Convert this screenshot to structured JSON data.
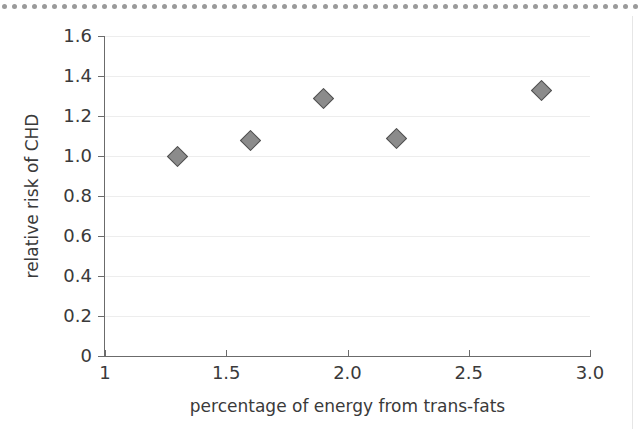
{
  "decor": {
    "top_dots_count": 64,
    "dot_color": "#9a9a9a",
    "right_rule_color": "#e6e6e6"
  },
  "axes": {
    "y_tick_labels": [
      "1.6",
      "1.4",
      "1.2",
      "1.0",
      "0.8",
      "0.6",
      "0.4",
      "0.2",
      "0"
    ],
    "y_tick_values": [
      1.6,
      1.4,
      1.2,
      1.0,
      0.8,
      0.6,
      0.4,
      0.2,
      0
    ],
    "x_tick_labels": [
      "1",
      "1.5",
      "2.0",
      "2.5",
      "3.0"
    ],
    "x_tick_values": [
      1,
      1.5,
      2.0,
      2.5,
      3.0
    ]
  },
  "chart_data": {
    "type": "scatter",
    "title": "",
    "xlabel": "percentage of energy from trans-fats",
    "ylabel": "relative risk of CHD",
    "xlim": [
      1,
      3.0
    ],
    "ylim": [
      0,
      1.6
    ],
    "grid": true,
    "legend": "none",
    "marker": {
      "shape": "diamond",
      "fill": "#8b8b8b",
      "edge": "#4f4f4f",
      "size_px": 15
    },
    "x": [
      1.3,
      1.6,
      1.9,
      2.2,
      2.8
    ],
    "y": [
      1.0,
      1.08,
      1.29,
      1.09,
      1.33
    ],
    "points": [
      {
        "x": 1.3,
        "y": 1.0
      },
      {
        "x": 1.6,
        "y": 1.08
      },
      {
        "x": 1.9,
        "y": 1.29
      },
      {
        "x": 2.2,
        "y": 1.09
      },
      {
        "x": 2.8,
        "y": 1.33
      }
    ],
    "xticks": [
      1,
      1.5,
      2.0,
      2.5,
      3.0
    ],
    "xticklabels": [
      "1",
      "1.5",
      "2.0",
      "2.5",
      "3.0"
    ],
    "yticks": [
      0,
      0.2,
      0.4,
      0.6,
      0.8,
      1.0,
      1.2,
      1.4,
      1.6
    ],
    "yticklabels": [
      "0",
      "0.2",
      "0.4",
      "0.6",
      "0.8",
      "1.0",
      "1.2",
      "1.4",
      "1.6"
    ]
  }
}
